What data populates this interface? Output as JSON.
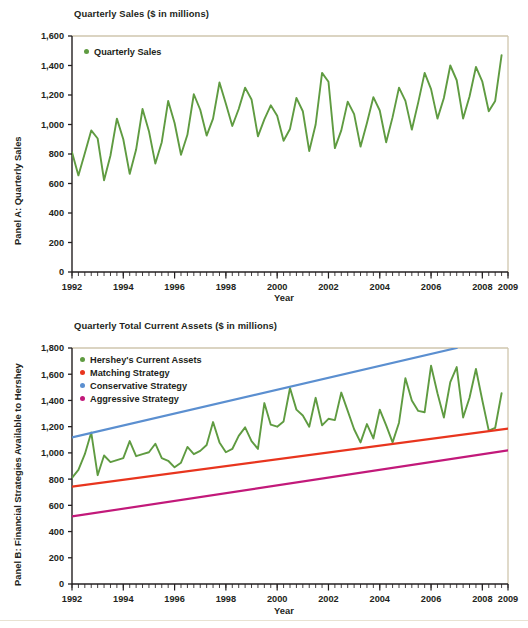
{
  "figure": {
    "background": "#ffffff",
    "axis_color": "#231f20",
    "frame_color": "#cfc6ae"
  },
  "panel_a": {
    "title": "Quarterly Sales ($ in millions)",
    "ylabel": "Panel A: Quarterly Sales",
    "xlabel": "Year",
    "legend": [
      {
        "label": "Quarterly Sales",
        "color": "#5f9b41"
      }
    ]
  },
  "panel_b": {
    "title": "Quarterly Total Current Assets ($ in millions)",
    "ylabel": "Panel B: Financial Strategies Available to Hershey",
    "xlabel": "Year",
    "legend": [
      {
        "label": "Hershey's Current Assets",
        "color": "#5f9b41"
      },
      {
        "label": "Matching Strategy",
        "color": "#e8351e"
      },
      {
        "label": "Conservative Strategy",
        "color": "#5b8fd0"
      },
      {
        "label": "Aggressive Strategy",
        "color": "#c2197a"
      }
    ]
  },
  "chart_data": [
    {
      "type": "line",
      "panel": "Panel A",
      "title": "Quarterly Sales ($ in millions)",
      "xlabel": "Year",
      "ylabel": "Panel A: Quarterly Sales",
      "xlim": [
        1992.0,
        2009.0
      ],
      "ylim": [
        0,
        1600
      ],
      "yticks": [
        0,
        200,
        400,
        600,
        800,
        1000,
        1200,
        1400,
        1600
      ],
      "yticklabels": [
        "0",
        "200",
        "400",
        "600",
        "800",
        "1,000",
        "1,200",
        "1,400",
        "1,600"
      ],
      "xticks": [
        1992,
        1994,
        1996,
        1998,
        2000,
        2002,
        2004,
        2006,
        2008,
        2009
      ],
      "xticklabels": [
        "1992",
        "1994",
        "1996",
        "1998",
        "2000",
        "2002",
        "2004",
        "2006",
        "2008",
        "2009"
      ],
      "minor_xtick_interval": 0.25,
      "grid": false,
      "legend_position": "upper-left",
      "series": [
        {
          "name": "Quarterly Sales",
          "color": "#5f9b41",
          "x": [
            1992.0,
            1992.25,
            1992.5,
            1992.75,
            1993.0,
            1993.25,
            1993.5,
            1993.75,
            1994.0,
            1994.25,
            1994.5,
            1994.75,
            1995.0,
            1995.25,
            1995.5,
            1995.75,
            1996.0,
            1996.25,
            1996.5,
            1996.75,
            1997.0,
            1997.25,
            1997.5,
            1997.75,
            1998.0,
            1998.25,
            1998.5,
            1998.75,
            1999.0,
            1999.25,
            1999.5,
            1999.75,
            2000.0,
            2000.25,
            2000.5,
            2000.75,
            2001.0,
            2001.25,
            2001.5,
            2001.75,
            2002.0,
            2002.25,
            2002.5,
            2002.75,
            2003.0,
            2003.25,
            2003.5,
            2003.75,
            2004.0,
            2004.25,
            2004.5,
            2004.75,
            2005.0,
            2005.25,
            2005.5,
            2005.75,
            2006.0,
            2006.25,
            2006.5,
            2006.75,
            2007.0,
            2007.25,
            2007.5,
            2007.75,
            2008.0,
            2008.25,
            2008.5,
            2008.75
          ],
          "y": [
            812,
            655,
            805,
            960,
            905,
            622,
            790,
            1040,
            900,
            665,
            830,
            1105,
            955,
            735,
            880,
            1160,
            1010,
            795,
            930,
            1205,
            1100,
            925,
            1040,
            1285,
            1140,
            990,
            1105,
            1250,
            1170,
            920,
            1035,
            1130,
            1060,
            890,
            970,
            1180,
            1090,
            820,
            1000,
            1350,
            1290,
            840,
            960,
            1155,
            1070,
            850,
            1010,
            1185,
            1095,
            880,
            1050,
            1250,
            1160,
            965,
            1150,
            1350,
            1240,
            1040,
            1180,
            1400,
            1300,
            1040,
            1190,
            1390,
            1290,
            1090,
            1160,
            1470
          ]
        }
      ]
    },
    {
      "type": "line",
      "panel": "Panel B",
      "title": "Quarterly Total Current Assets ($ in millions)",
      "xlabel": "Year",
      "ylabel": "Panel B: Financial Strategies Available to Hershey",
      "xlim": [
        1992.0,
        2009.0
      ],
      "ylim": [
        0,
        1800
      ],
      "yticks": [
        0,
        200,
        400,
        600,
        800,
        1000,
        1200,
        1400,
        1600,
        1800
      ],
      "yticklabels": [
        "0",
        "200",
        "400",
        "600",
        "800",
        "1,000",
        "1,200",
        "1,400",
        "1,600",
        "1,800"
      ],
      "xticks": [
        1992,
        1994,
        1996,
        1998,
        2000,
        2002,
        2004,
        2006,
        2008,
        2009
      ],
      "xticklabels": [
        "1992",
        "1994",
        "1996",
        "1998",
        "2000",
        "2002",
        "2004",
        "2006",
        "2008",
        "2009"
      ],
      "minor_xtick_interval": 0.25,
      "grid": false,
      "legend_position": "upper-left",
      "series": [
        {
          "name": "Hershey's Current Assets",
          "color": "#5f9b41",
          "x": [
            1992.0,
            1992.25,
            1992.5,
            1992.75,
            1993.0,
            1993.25,
            1993.5,
            1993.75,
            1994.0,
            1994.25,
            1994.5,
            1994.75,
            1995.0,
            1995.25,
            1995.5,
            1995.75,
            1996.0,
            1996.25,
            1996.5,
            1996.75,
            1997.0,
            1997.25,
            1997.5,
            1997.75,
            1998.0,
            1998.25,
            1998.5,
            1998.75,
            1999.0,
            1999.25,
            1999.5,
            1999.75,
            2000.0,
            2000.25,
            2000.5,
            2000.75,
            2001.0,
            2001.25,
            2001.5,
            2001.75,
            2002.0,
            2002.25,
            2002.5,
            2002.75,
            2003.0,
            2003.25,
            2003.5,
            2003.75,
            2004.0,
            2004.25,
            2004.5,
            2004.75,
            2005.0,
            2005.25,
            2005.5,
            2005.75,
            2006.0,
            2006.25,
            2006.5,
            2006.75,
            2007.0,
            2007.25,
            2007.5,
            2007.75,
            2008.0,
            2008.25,
            2008.5,
            2008.75
          ],
          "y": [
            810,
            870,
            990,
            1155,
            830,
            980,
            930,
            945,
            960,
            1090,
            975,
            990,
            1005,
            1070,
            960,
            940,
            890,
            925,
            1045,
            990,
            1015,
            1060,
            1235,
            1080,
            1005,
            1030,
            1130,
            1195,
            1090,
            1030,
            1380,
            1215,
            1200,
            1240,
            1495,
            1330,
            1285,
            1200,
            1420,
            1210,
            1260,
            1250,
            1460,
            1320,
            1180,
            1080,
            1220,
            1110,
            1330,
            1210,
            1080,
            1230,
            1570,
            1400,
            1320,
            1310,
            1665,
            1455,
            1270,
            1540,
            1655,
            1270,
            1420,
            1640,
            1400,
            1170,
            1190,
            1455
          ]
        },
        {
          "name": "Matching Strategy",
          "color": "#e8351e",
          "x": [
            1992.0,
            2009.0
          ],
          "y": [
            742,
            1185
          ]
        },
        {
          "name": "Conservative Strategy",
          "color": "#5b8fd0",
          "x": [
            1992.0,
            2007.0
          ],
          "y": [
            1118,
            1800
          ]
        },
        {
          "name": "Aggressive Strategy",
          "color": "#c2197a",
          "x": [
            1992.0,
            2009.0
          ],
          "y": [
            515,
            1020
          ]
        }
      ]
    }
  ]
}
